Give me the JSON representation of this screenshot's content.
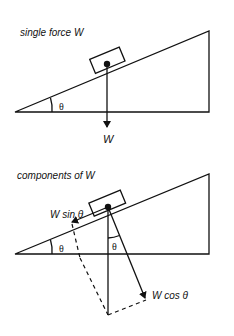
{
  "diagram_top": {
    "title": "single force W",
    "angle_label": "θ",
    "force_label": "W"
  },
  "diagram_bottom": {
    "title": "components of W",
    "angle_label_incline": "θ",
    "angle_label_vertical": "θ",
    "parallel_component_label": "W sin θ",
    "perpendicular_component_label": "W cos θ"
  },
  "colors": {
    "stroke": "#111111",
    "background": "#ffffff"
  }
}
